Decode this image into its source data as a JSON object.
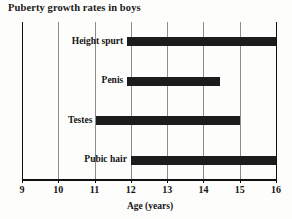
{
  "chart_data": {
    "type": "bar",
    "orientation": "horizontal",
    "title": "Puberty growth rates in boys",
    "xlabel": "Age (years)",
    "ylabel": "",
    "xlim": [
      9,
      16
    ],
    "xticks": [
      9,
      10,
      11,
      12,
      13,
      14,
      15,
      16
    ],
    "xticklabels": [
      "9",
      "10",
      "11",
      "12",
      "13",
      "14",
      "15",
      "16"
    ],
    "grid": true,
    "grid_axis": "x",
    "legend": false,
    "bar_color": "#1c1c1c",
    "categories": [
      "Height spurt",
      "Penis",
      "Testes",
      "Pubic hair"
    ],
    "ranges": [
      {
        "label": "Height spurt",
        "start": 11.9,
        "end": 16.0
      },
      {
        "label": "Penis",
        "start": 11.9,
        "end": 14.45
      },
      {
        "label": "Testes",
        "start": 11.05,
        "end": 15.0
      },
      {
        "label": "Pubic hair",
        "start": 12.0,
        "end": 16.0
      }
    ]
  }
}
